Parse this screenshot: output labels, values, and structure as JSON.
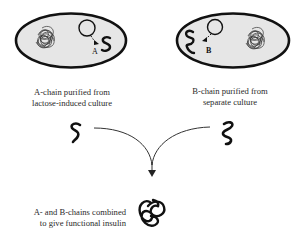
{
  "cells": {
    "left": {
      "chain_label": "A",
      "caption": [
        "A-chain purified from",
        "lactose-induced culture"
      ]
    },
    "right": {
      "chain_label": "B",
      "caption": [
        "B-chain purified from",
        "separate culture"
      ]
    }
  },
  "result": {
    "caption": [
      "A- and B-chains combined",
      "to give functional insulin"
    ]
  },
  "colors": {
    "cell_fill": "#e6e6e6",
    "cell_stroke": "#111111",
    "ink": "#111111",
    "arrow": "#333333"
  }
}
